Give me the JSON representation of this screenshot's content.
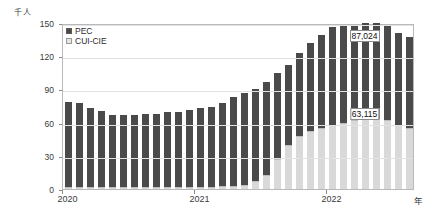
{
  "chart_data": {
    "type": "bar",
    "title": "",
    "subtitle": "",
    "stacked": true,
    "unit_label": "千人",
    "xlabel": "年",
    "ylabel": "",
    "ylim": [
      0,
      150
    ],
    "yticks": [
      0,
      30,
      60,
      90,
      120,
      150
    ],
    "grid": true,
    "legend_position": "top-left",
    "categories": [
      "2020-01",
      "2020-02",
      "2020-03",
      "2020-04",
      "2020-05",
      "2020-06",
      "2020-07",
      "2020-08",
      "2020-09",
      "2020-10",
      "2020-11",
      "2020-12",
      "2021-01",
      "2021-02",
      "2021-03",
      "2021-04",
      "2021-05",
      "2021-06",
      "2021-07",
      "2021-08",
      "2021-09",
      "2021-10",
      "2021-11",
      "2021-12",
      "2022-01",
      "2022-02",
      "2022-03",
      "2022-04",
      "2022-05",
      "2022-06",
      "2022-07",
      "2022-08"
    ],
    "series": [
      {
        "name": "CUI-CIE",
        "color": "#d9d9d9",
        "values": [
          2.0,
          1.5,
          1.5,
          1.5,
          1.5,
          1.5,
          1.5,
          1.5,
          1.5,
          1.5,
          1.5,
          1.5,
          1.5,
          2.0,
          2.5,
          3.0,
          4.0,
          7.0,
          13.0,
          27.0,
          40.0,
          48.0,
          52.0,
          55.0,
          58.0,
          60.0,
          62.0,
          63.1,
          63.1,
          62.0,
          58.0,
          55.0
        ]
      },
      {
        "name": "PEC",
        "color": "#4a4a4a",
        "values": [
          77.0,
          76.5,
          71.5,
          69.0,
          65.5,
          65.0,
          65.5,
          66.0,
          66.5,
          68.5,
          68.0,
          69.5,
          72.0,
          72.5,
          75.5,
          80.5,
          82.5,
          83.0,
          84.0,
          78.0,
          72.0,
          75.0,
          80.0,
          84.0,
          88.0,
          87.0,
          85.0,
          86.9,
          87.0,
          86.0,
          83.0,
          82.0
        ]
      }
    ],
    "xticks": [
      {
        "label": "2020",
        "index": 0
      },
      {
        "label": "2021",
        "index": 12
      },
      {
        "label": "2022",
        "index": 24
      }
    ],
    "annotations": [
      {
        "name": "pec-value-label",
        "text": "87,024",
        "index": 27,
        "segment": "PEC"
      },
      {
        "name": "cui-value-label",
        "text": "63,115",
        "index": 27,
        "segment": "CUI-CIE"
      }
    ]
  },
  "legend": {
    "items": [
      {
        "label": "PEC",
        "color": "#4a4a4a"
      },
      {
        "label": "CUI-CIE",
        "color": "#e4e4e4"
      }
    ]
  },
  "axis": {
    "unit": "千人",
    "x_unit": "年"
  }
}
